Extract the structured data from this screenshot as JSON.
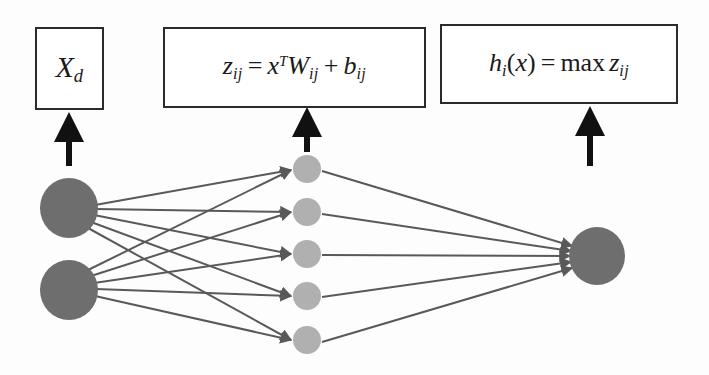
{
  "figure": {
    "background_color": "#fdfdfd",
    "boxes": [
      {
        "id": "input-box",
        "label": "X_d",
        "parts": {
          "base": "X",
          "sub": "d"
        },
        "x": 35,
        "y": 27,
        "w": 69,
        "h": 83,
        "font_size": 30
      },
      {
        "id": "z-box",
        "label": "z_ij = x^T W_ij + b_ij",
        "parts": {
          "z": "z",
          "z_sub": "ij",
          "eq": "=",
          "x": "x",
          "x_sup": "T",
          "w": "W",
          "w_sub": "ij",
          "plus": "+",
          "b": "b",
          "b_sub": "ij"
        },
        "x": 163,
        "y": 27,
        "w": 263,
        "h": 81,
        "font_size": 26
      },
      {
        "id": "h-box",
        "label": "h_i(x) = max z_ij",
        "parts": {
          "h": "h",
          "h_sub": "i",
          "paren_open": "(",
          "x": "x",
          "paren_close": ")",
          "eq": "=",
          "max": "max",
          "z": "z",
          "z_sub": "ij"
        },
        "x": 440,
        "y": 24,
        "w": 238,
        "h": 80,
        "font_size": 26
      }
    ],
    "pointer_arrows": [
      {
        "id": "arrow-to-input-box",
        "x": 69,
        "y_top": 118,
        "y_bottom": 166
      },
      {
        "id": "arrow-to-z-box",
        "x": 307,
        "y_top": 113,
        "y_bottom": 152
      },
      {
        "id": "arrow-to-h-box",
        "x": 590,
        "y_top": 112,
        "y_bottom": 166
      }
    ],
    "layers": {
      "input": {
        "name": "input-layer",
        "color": "#6e6e6e",
        "radius": 29,
        "nodes": [
          {
            "id": "input-node-1",
            "cx": 69,
            "cy": 208
          },
          {
            "id": "input-node-2",
            "cx": 69,
            "cy": 290
          }
        ]
      },
      "hidden": {
        "name": "hidden-layer",
        "color": "#b0b0b0",
        "radius": 14,
        "nodes": [
          {
            "id": "hidden-node-1",
            "cx": 307,
            "cy": 169
          },
          {
            "id": "hidden-node-2",
            "cx": 307,
            "cy": 212
          },
          {
            "id": "hidden-node-3",
            "cx": 307,
            "cy": 254
          },
          {
            "id": "hidden-node-4",
            "cx": 307,
            "cy": 296
          },
          {
            "id": "hidden-node-5",
            "cx": 307,
            "cy": 340
          }
        ]
      },
      "output": {
        "name": "output-layer",
        "color": "#6e6e6e",
        "radius": 28,
        "nodes": [
          {
            "id": "output-node-1",
            "cx": 597,
            "cy": 256
          }
        ]
      }
    },
    "edge_color": "#595959",
    "edge_width": 2,
    "edges_input_to_hidden": [
      {
        "from": "input-node-1",
        "to": "hidden-node-1"
      },
      {
        "from": "input-node-1",
        "to": "hidden-node-2"
      },
      {
        "from": "input-node-1",
        "to": "hidden-node-3"
      },
      {
        "from": "input-node-1",
        "to": "hidden-node-4"
      },
      {
        "from": "input-node-1",
        "to": "hidden-node-5"
      },
      {
        "from": "input-node-2",
        "to": "hidden-node-1"
      },
      {
        "from": "input-node-2",
        "to": "hidden-node-2"
      },
      {
        "from": "input-node-2",
        "to": "hidden-node-3"
      },
      {
        "from": "input-node-2",
        "to": "hidden-node-4"
      },
      {
        "from": "input-node-2",
        "to": "hidden-node-5"
      }
    ],
    "edges_hidden_to_output": [
      {
        "from": "hidden-node-1",
        "to": "output-node-1"
      },
      {
        "from": "hidden-node-2",
        "to": "output-node-1"
      },
      {
        "from": "hidden-node-3",
        "to": "output-node-1"
      },
      {
        "from": "hidden-node-4",
        "to": "output-node-1"
      },
      {
        "from": "hidden-node-5",
        "to": "output-node-1"
      }
    ]
  }
}
